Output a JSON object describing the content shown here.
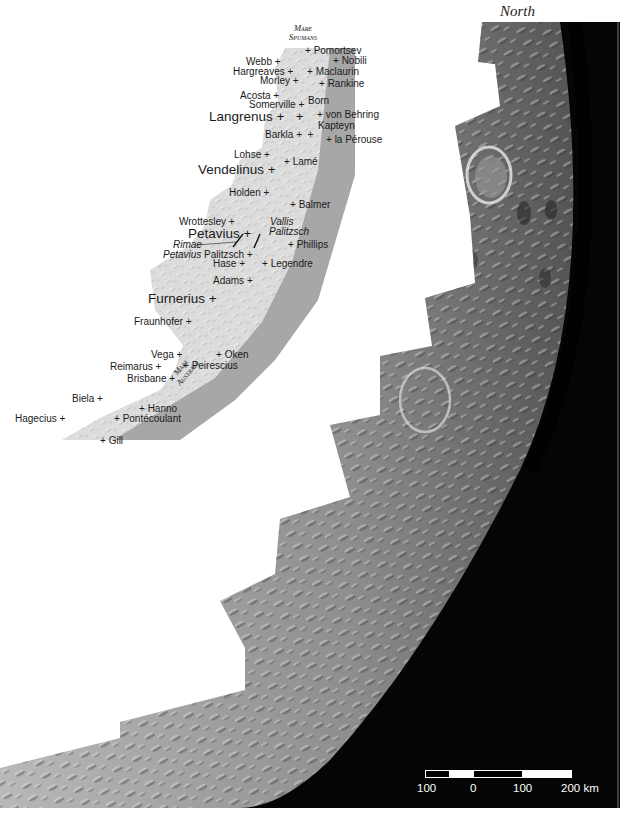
{
  "figure": {
    "orientation_label": "North",
    "partial_title_top_right": "",
    "colors": {
      "background": "#ffffff",
      "space": "#050505",
      "map_light": "#d9d9d9",
      "map_dark": "#a4a4a4",
      "label_text": "#1a1a1a",
      "scale_text": "#ffffff"
    }
  },
  "inset_map": {
    "maria": [
      {
        "name_line1": "Mare",
        "name_line2": "Spumans"
      },
      {
        "name_line1": "Mare",
        "name_line2": "Australe"
      }
    ],
    "features": [
      {
        "name": "Pomortsev",
        "size": "small",
        "marker": "left"
      },
      {
        "name": "Nobili",
        "size": "small",
        "marker": "left"
      },
      {
        "name": "Webb",
        "size": "small",
        "marker": "right"
      },
      {
        "name": "Hargreaves",
        "size": "small",
        "marker": "right"
      },
      {
        "name": "Maclaurin",
        "size": "small",
        "marker": "left"
      },
      {
        "name": "Morley",
        "size": "small",
        "marker": "right"
      },
      {
        "name": "Rankine",
        "size": "small",
        "marker": "left"
      },
      {
        "name": "Acosta",
        "size": "small",
        "marker": "right"
      },
      {
        "name": "Somerville",
        "size": "small",
        "marker": "right"
      },
      {
        "name": "Born",
        "size": "small",
        "marker": "left"
      },
      {
        "name": "Langrenus",
        "size": "large",
        "marker": "right"
      },
      {
        "name": "von Behring",
        "size": "small",
        "marker": "left"
      },
      {
        "name": "Kapteyn",
        "size": "small",
        "marker": "none"
      },
      {
        "name": "Barkla",
        "size": "small",
        "marker": "right"
      },
      {
        "name": "la Pérouse",
        "size": "small",
        "marker": "left"
      },
      {
        "name": "Lohse",
        "size": "small",
        "marker": "right"
      },
      {
        "name": "Lamé",
        "size": "small",
        "marker": "left"
      },
      {
        "name": "Vendelinus",
        "size": "large",
        "marker": "right"
      },
      {
        "name": "Holden",
        "size": "small",
        "marker": "right"
      },
      {
        "name": "Balmer",
        "size": "small",
        "marker": "left"
      },
      {
        "name": "Wrottesley",
        "size": "small",
        "marker": "right"
      },
      {
        "name": "Petavius",
        "size": "large",
        "marker": "right"
      },
      {
        "name": "Vallis",
        "size": "small",
        "italic": true
      },
      {
        "name": "Palitzsch",
        "size": "small",
        "italic": true
      },
      {
        "name": "Rimae",
        "size": "small",
        "italic": true
      },
      {
        "name": "Petavius",
        "size": "small",
        "italic": true
      },
      {
        "name": "Palitzsch",
        "size": "small",
        "marker": "right"
      },
      {
        "name": "Phillips",
        "size": "small",
        "marker": "left"
      },
      {
        "name": "Hase",
        "size": "small",
        "marker": "right"
      },
      {
        "name": "Legendre",
        "size": "small",
        "marker": "left"
      },
      {
        "name": "Adams",
        "size": "small",
        "marker": "right"
      },
      {
        "name": "Furnerius",
        "size": "large",
        "marker": "right"
      },
      {
        "name": "Fraunhofer",
        "size": "small",
        "marker": "right"
      },
      {
        "name": "Vega",
        "size": "small",
        "marker": "right"
      },
      {
        "name": "Oken",
        "size": "small",
        "marker": "left"
      },
      {
        "name": "Reimarus",
        "size": "small",
        "marker": "right"
      },
      {
        "name": "Peirescius",
        "size": "small",
        "marker": "left"
      },
      {
        "name": "Brisbane",
        "size": "small",
        "marker": "right"
      },
      {
        "name": "Biela",
        "size": "small",
        "marker": "right"
      },
      {
        "name": "Hanno",
        "size": "small",
        "marker": "left"
      },
      {
        "name": "Hagecius",
        "size": "small",
        "marker": "right"
      },
      {
        "name": "Pontécoulant",
        "size": "small",
        "marker": "left"
      },
      {
        "name": "Gill",
        "size": "small",
        "marker": "left"
      }
    ]
  },
  "scale_bar": {
    "ticks": [
      "100",
      "0",
      "100",
      "200 km"
    ],
    "unit": "km"
  }
}
